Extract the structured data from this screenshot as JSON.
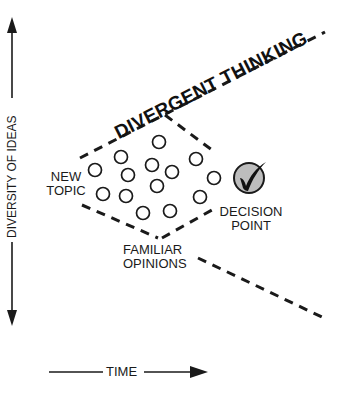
{
  "diagram": {
    "title": "DIVERGENT THINKING",
    "y_axis_label": "DIVERSITY OF IDEAS",
    "x_axis_label": "TIME",
    "labels": {
      "new_topic_line1": "NEW",
      "new_topic_line2": "TOPIC",
      "decision_line1": "DECISION",
      "decision_line2": "POINT",
      "familiar_line1": "FAMILIAR",
      "familiar_line2": "OPINIONS"
    },
    "icons": {
      "decision": "checkmark-circle-icon",
      "idea": "idea-circle-icon"
    },
    "colors": {
      "ink": "#1a1a1a",
      "decision_fill": "#bdbdbd",
      "background": "#ffffff"
    },
    "idea_circles": [
      {
        "x": 95,
        "y": 170
      },
      {
        "x": 121,
        "y": 157
      },
      {
        "x": 159,
        "y": 141
      },
      {
        "x": 152,
        "y": 165
      },
      {
        "x": 172,
        "y": 172
      },
      {
        "x": 196,
        "y": 159
      },
      {
        "x": 128,
        "y": 175
      },
      {
        "x": 157,
        "y": 186
      },
      {
        "x": 214,
        "y": 177
      },
      {
        "x": 103,
        "y": 193
      },
      {
        "x": 126,
        "y": 196
      },
      {
        "x": 200,
        "y": 197
      },
      {
        "x": 143,
        "y": 213
      },
      {
        "x": 170,
        "y": 211
      }
    ]
  }
}
